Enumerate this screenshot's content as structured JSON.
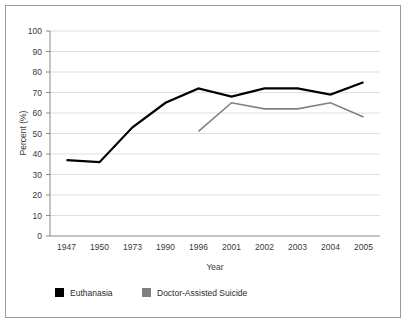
{
  "chart_data": {
    "type": "line",
    "title": "",
    "xlabel": "Year",
    "ylabel": "Percent (%)",
    "categories": [
      "1947",
      "1950",
      "1973",
      "1990",
      "1996",
      "2001",
      "2002",
      "2003",
      "2004",
      "2005"
    ],
    "ylim": [
      0,
      100
    ],
    "yticks": [
      "0",
      "10",
      "20",
      "30",
      "40",
      "50",
      "60",
      "70",
      "80",
      "90",
      "100"
    ],
    "grid": true,
    "legend_position": "bottom-left",
    "series": [
      {
        "name": "Euthanasia",
        "color": "#000000",
        "values": [
          37,
          36,
          53,
          65,
          72,
          68,
          72,
          72,
          69,
          75
        ]
      },
      {
        "name": "Doctor-Assisted Suicide",
        "color": "#808080",
        "values": [
          null,
          null,
          null,
          null,
          51,
          65,
          62,
          62,
          65,
          58
        ]
      }
    ]
  },
  "axes": {
    "y_title": "Percent (%)",
    "x_title": "Year"
  },
  "legend": {
    "items": [
      {
        "label": "Euthanasia",
        "swatch_color": "#000000"
      },
      {
        "label": "Doctor-Assisted Suicide",
        "swatch_color": "#808080"
      }
    ]
  },
  "colors": {
    "frame_border": "#9a9a9a",
    "gridline": "#c9c9c9",
    "axis": "#7d7d7d",
    "text": "#3a3a3a",
    "background": "#ffffff"
  }
}
